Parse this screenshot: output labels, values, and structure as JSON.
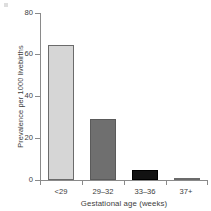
{
  "chart_data": {
    "type": "bar",
    "title": "",
    "subtitle": "",
    "xlabel": "Gestational age (weeks)",
    "ylabel": "Prevalence per 1000 livebirths",
    "categories": [
      "<29",
      "29–32",
      "33–36",
      "37+"
    ],
    "values": [
      64.5,
      29.0,
      4.8,
      1.0
    ],
    "series": [
      {
        "name": "Prevalence per 1000 livebirths",
        "values": [
          64.5,
          29.0,
          4.8,
          1.0
        ]
      }
    ],
    "bar_colors": [
      "#d6d6d6",
      "#6f6f6f",
      "#121212",
      "#8c8c8c"
    ],
    "bar_edge_colors": [
      "#6b6b6b",
      "#5a5a5a",
      "#000000",
      "#6b6b6b"
    ],
    "ylim": [
      0,
      80
    ],
    "yticks": [
      0,
      20,
      40,
      60,
      80
    ],
    "ytick_labels": [
      "0",
      "20",
      "40",
      "60",
      "80"
    ],
    "grid": false,
    "legend": false,
    "legend_position": "none",
    "axis_color": "#8a8a8a",
    "text_color": "#3d3d3d",
    "background": "#ffffff"
  }
}
